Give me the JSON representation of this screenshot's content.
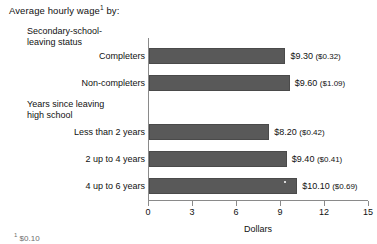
{
  "chart_data": {
    "type": "bar",
    "orientation": "horizontal",
    "title": "Average hourly wage",
    "title_footnote_marker": "1",
    "title_suffix": " by:",
    "xlabel": "Dollars",
    "ylabel": "",
    "xlim": [
      0,
      15
    ],
    "xticks": [
      0,
      3,
      6,
      9,
      12,
      15
    ],
    "xtick_labels": [
      "0",
      "3",
      "6",
      "9",
      "12",
      "15"
    ],
    "grid": false,
    "legend": null,
    "groups": [
      {
        "heading": "Secondary-school-\nleaving status",
        "categories": [
          "Completers",
          "Non-completers"
        ],
        "values": [
          9.3,
          9.6
        ],
        "standard_errors": [
          0.32,
          1.09
        ],
        "value_labels": [
          "$9.30",
          "$9.60"
        ],
        "se_labels": [
          "($0.32)",
          "($1.09)"
        ]
      },
      {
        "heading": "Years since leaving\nhigh school",
        "categories": [
          "Less than 2 years",
          "2 up to 4 years",
          "4 up to 6 years"
        ],
        "values": [
          8.2,
          9.4,
          10.1
        ],
        "standard_errors": [
          0.42,
          0.41,
          0.69
        ],
        "value_labels": [
          "$8.20",
          "$9.40",
          "$10.10"
        ],
        "se_labels": [
          "($0.42)",
          "($0.41)",
          "($0.69)"
        ]
      }
    ],
    "categories": [
      "Completers",
      "Non-completers",
      "Less than 2 years",
      "2 up to 4 years",
      "4 up to 6 years"
    ],
    "values": [
      9.3,
      9.6,
      8.2,
      9.4,
      10.1
    ],
    "bar_color": "#595959"
  },
  "bars": [
    {
      "label": "Completers",
      "value_label": "$9.30",
      "se_label": "($0.32)",
      "value": 9.3,
      "top": 48
    },
    {
      "label": "Non-completers",
      "value_label": "$9.60",
      "se_label": "($1.09)",
      "value": 9.6,
      "top": 75
    },
    {
      "label": "Less than 2 years",
      "value_label": "$8.20",
      "se_label": "($0.42)",
      "value": 8.2,
      "top": 124
    },
    {
      "label": "2 up to 4 years",
      "value_label": "$9.40",
      "se_label": "($0.41)",
      "value": 9.4,
      "top": 151
    },
    {
      "label": "4 up to 6 years",
      "value_label": "$10.10",
      "se_label": "($0.69)",
      "value": 10.1,
      "top": 178
    }
  ],
  "axis": {
    "title": "Dollars",
    "ticks": [
      "0",
      "3",
      "6",
      "9",
      "12",
      "15"
    ]
  },
  "headings": {
    "group1": "Secondary-school-\nleaving status",
    "group2": "Years since leaving\nhigh school"
  },
  "title": {
    "text": "Average hourly wage",
    "marker": "1",
    "suffix": " by:"
  },
  "footnote": {
    "marker": "1",
    "text": "$0.10"
  }
}
